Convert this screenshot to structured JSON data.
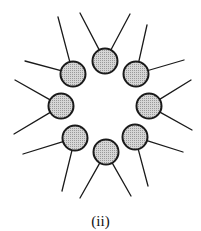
{
  "figure": {
    "caption": "(ii)",
    "head_fill": "#c8c8c8",
    "stroke": "#1a1a1a",
    "head_radius": 12.5,
    "molecules": [
      {
        "name": "top",
        "cx": 105,
        "cy": 61,
        "tails": [
          [
            80,
            13
          ],
          [
            130,
            14
          ]
        ]
      },
      {
        "name": "upper-right",
        "cx": 136,
        "cy": 74,
        "tails": [
          [
            147,
            25
          ],
          [
            184,
            60
          ]
        ]
      },
      {
        "name": "right",
        "cx": 149,
        "cy": 106,
        "tails": [
          [
            191,
            80
          ],
          [
            192,
            130
          ]
        ]
      },
      {
        "name": "lower-right",
        "cx": 135,
        "cy": 137,
        "tails": [
          [
            183,
            152
          ],
          [
            148,
            186
          ]
        ]
      },
      {
        "name": "bottom",
        "cx": 106,
        "cy": 152,
        "tails": [
          [
            80,
            198
          ],
          [
            131,
            196
          ]
        ]
      },
      {
        "name": "lower-left",
        "cx": 75,
        "cy": 138,
        "tails": [
          [
            23,
            154
          ],
          [
            62,
            191
          ]
        ]
      },
      {
        "name": "left",
        "cx": 61,
        "cy": 106,
        "tails": [
          [
            15,
            80
          ],
          [
            14,
            134
          ]
        ]
      },
      {
        "name": "upper-left",
        "cx": 73,
        "cy": 74,
        "tails": [
          [
            25,
            61
          ],
          [
            58,
            17
          ]
        ]
      }
    ]
  }
}
